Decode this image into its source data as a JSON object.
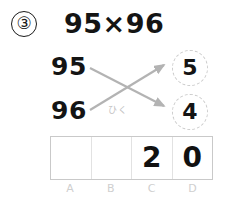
{
  "problem": {
    "number_label": "③",
    "expression": "95×96"
  },
  "working": {
    "operands": [
      {
        "value": "95"
      },
      {
        "value": "96"
      }
    ],
    "subtract_label": "ひく",
    "results": [
      {
        "value": "5"
      },
      {
        "value": "4"
      }
    ],
    "arrow_color": "#b3b3b3",
    "bubble_border_color": "#cccccc"
  },
  "answer_table": {
    "columns": [
      {
        "label": "A",
        "value": ""
      },
      {
        "label": "B",
        "value": ""
      },
      {
        "label": "C",
        "value": "2"
      },
      {
        "label": "D",
        "value": "0"
      }
    ],
    "border_color": "#c9c9c9",
    "divider_color": "#e2e2e2",
    "label_color": "#cfcfcf"
  }
}
